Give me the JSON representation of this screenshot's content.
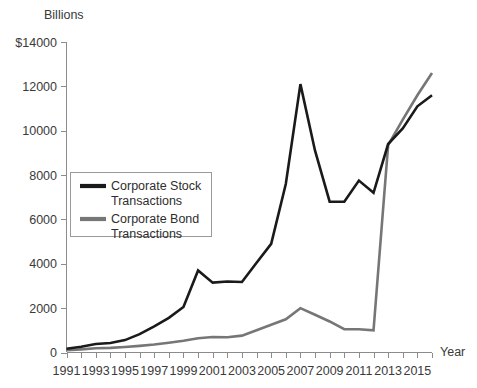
{
  "chart_data": {
    "type": "line",
    "title": "",
    "subtitle": "",
    "units_label": "Billions",
    "xlabel": "Year",
    "ylabel": "",
    "y_axis_prefix": "$",
    "grid": false,
    "legend_position": "inside-left",
    "xlim": [
      1991,
      2016
    ],
    "ylim": [
      0,
      14000
    ],
    "y_ticks": [
      0,
      2000,
      4000,
      6000,
      8000,
      10000,
      12000,
      14000
    ],
    "y_tick_labels": [
      "0",
      "2000",
      "4000",
      "6000",
      "8000",
      "10000",
      "12000",
      "$14000"
    ],
    "x_ticks": [
      1991,
      1992,
      1993,
      1994,
      1995,
      1996,
      1997,
      1998,
      1999,
      2000,
      2001,
      2002,
      2003,
      2004,
      2005,
      2006,
      2007,
      2008,
      2009,
      2010,
      2011,
      2012,
      2013,
      2014,
      2015,
      2016
    ],
    "x_tick_labels": [
      "1991",
      "",
      "1993",
      "",
      "1995",
      "",
      "1997",
      "",
      "1999",
      "",
      "2001",
      "",
      "2003",
      "",
      "2005",
      "",
      "2007",
      "",
      "2009",
      "",
      "2011",
      "",
      "2013",
      "",
      "2015",
      ""
    ],
    "x": [
      1991,
      1992,
      1993,
      1994,
      1995,
      1996,
      1997,
      1998,
      1999,
      2000,
      2001,
      2002,
      2003,
      2004,
      2005,
      2006,
      2007,
      2008,
      2009,
      2010,
      2011,
      2012,
      2013,
      2014,
      2015,
      2016
    ],
    "series": [
      {
        "name": "Corporate Stock Transactions",
        "color": "#1a1a1a",
        "values": [
          170,
          260,
          380,
          430,
          560,
          830,
          1180,
          1560,
          2050,
          3700,
          3150,
          3200,
          3180,
          4050,
          4900,
          7600,
          12100,
          9100,
          6800,
          6800,
          7750,
          7200,
          9400,
          10100,
          11100,
          11600
        ]
      },
      {
        "name": "Corporate Bond Transactions",
        "color": "#767676",
        "values": [
          100,
          140,
          190,
          210,
          250,
          300,
          360,
          440,
          530,
          640,
          700,
          690,
          760,
          1000,
          1250,
          1500,
          2000,
          1700,
          1400,
          1050,
          1050,
          1000,
          9350,
          10500,
          11600,
          12600
        ]
      }
    ],
    "legend": [
      {
        "label_line1": "Corporate Stock",
        "label_line2": "Transactions",
        "color": "#1a1a1a"
      },
      {
        "label_line1": "Corporate Bond",
        "label_line2": "Transactions",
        "color": "#767676"
      }
    ]
  }
}
